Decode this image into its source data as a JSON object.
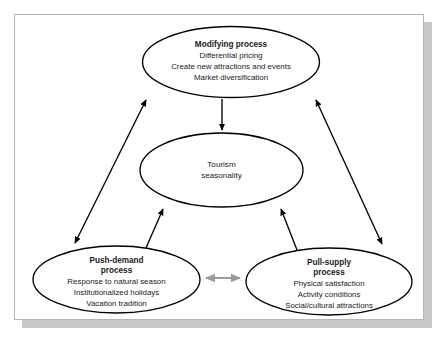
{
  "figure": {
    "background_color": "#ffffff",
    "frame_border_color": "#b5b5b5",
    "frame_shadow_color": "#c9c9c9",
    "stroke_color": "#000000",
    "gray_arrow_color": "#9a9a9a",
    "text_color": "#1a1a1a"
  },
  "nodes": {
    "modifying": {
      "id": "modifying-process",
      "title": "Modifying process",
      "lines": [
        "Differential pricing",
        "Create new attractions and events",
        "Market diversification"
      ]
    },
    "center": {
      "id": "tourism-seasonality",
      "title": "",
      "lines": [
        "Tourism",
        "seasonality"
      ]
    },
    "push": {
      "id": "push-demand-process",
      "title_lines": [
        "Push-demand",
        "process"
      ],
      "lines": [
        "Response to natural season",
        "Institutionalized holidays",
        "Vacation tradition"
      ]
    },
    "pull": {
      "id": "pull-supply-process",
      "title_lines": [
        "Pull-supply",
        "process"
      ],
      "lines": [
        "Physical satisfaction",
        "Activity conditions",
        "Social/cultural attractions"
      ]
    }
  },
  "connectors": [
    {
      "name": "modifying-to-center",
      "from": "modifying",
      "to": "center",
      "style": "single-arrow",
      "color": "#000000"
    },
    {
      "name": "modifying-push-bidirectional",
      "from": "modifying",
      "to": "push",
      "style": "double-arrow",
      "color": "#000000"
    },
    {
      "name": "modifying-pull-bidirectional",
      "from": "modifying",
      "to": "pull",
      "style": "double-arrow",
      "color": "#000000"
    },
    {
      "name": "push-to-center",
      "from": "push",
      "to": "center",
      "style": "single-arrow",
      "color": "#000000"
    },
    {
      "name": "pull-to-center",
      "from": "pull",
      "to": "center",
      "style": "single-arrow",
      "color": "#000000"
    },
    {
      "name": "push-pull-bidirectional",
      "from": "push",
      "to": "pull",
      "style": "double-arrow",
      "color": "#9a9a9a"
    }
  ]
}
